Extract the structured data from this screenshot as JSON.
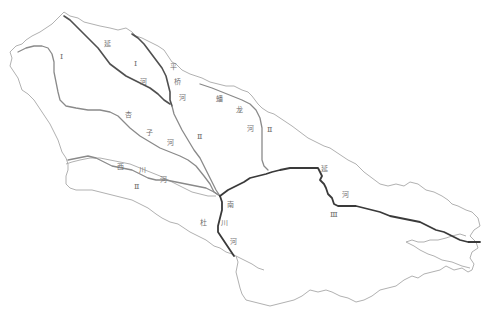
{
  "map": {
    "title": "",
    "colors": {
      "boundary": "#a8a8a8",
      "tributary": "#8a8a8a",
      "main_river": "#3a3a3a",
      "label": "#707070"
    },
    "rivers": [
      {
        "id": "yanhe-upper",
        "chars": [
          "延",
          "河"
        ]
      },
      {
        "id": "pingqiao",
        "chars": [
          "平",
          "桥",
          "河"
        ]
      },
      {
        "id": "panlong",
        "chars": [
          "蟠",
          "龙",
          "河"
        ]
      },
      {
        "id": "xingzi",
        "chars": [
          "杏",
          "子",
          "河"
        ]
      },
      {
        "id": "xichuan",
        "chars": [
          "西",
          "川",
          "河"
        ]
      },
      {
        "id": "nanchuan",
        "chars": [
          "南",
          "川",
          "河"
        ]
      },
      {
        "id": "yanhe-lower",
        "chars": [
          "延",
          "河"
        ]
      },
      {
        "id": "du",
        "chars": [
          "杜"
        ]
      }
    ],
    "zones": [
      {
        "id": "zone-1-west",
        "label": "Ⅰ"
      },
      {
        "id": "zone-1-north",
        "label": "Ⅰ"
      },
      {
        "id": "zone-2-center",
        "label": "Ⅱ"
      },
      {
        "id": "zone-2-east",
        "label": "Ⅱ"
      },
      {
        "id": "zone-2-south",
        "label": "Ⅱ"
      },
      {
        "id": "zone-3",
        "label": "Ⅲ"
      }
    ]
  }
}
